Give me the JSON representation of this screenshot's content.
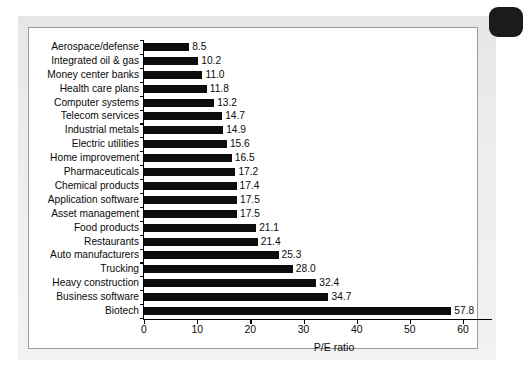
{
  "figure": {
    "card_background": "#ffffff",
    "plate_background": "#ececec",
    "bar_color": "#0d0d0d",
    "axis_color": "#000000",
    "corner_tab_color": "#1b1b1b",
    "corner_tab_name": "page-corner-tab"
  },
  "chart_data": {
    "type": "bar",
    "orientation": "horizontal",
    "title": "",
    "xlabel": "P/E ratio",
    "ylabel": "",
    "xlim": [
      0,
      60
    ],
    "xticks": [
      0,
      10,
      20,
      30,
      40,
      50,
      60
    ],
    "xtick_labels": [
      "0",
      "10",
      "20",
      "30",
      "40",
      "50",
      "60"
    ],
    "grid": false,
    "legend": null,
    "show_value_labels": true,
    "categories": [
      "Aerospace/defense",
      "Integrated oil & gas",
      "Money center banks",
      "Health care plans",
      "Computer systems",
      "Telecom services",
      "Industrial metals",
      "Electric utilities",
      "Home improvement",
      "Pharmaceuticals",
      "Chemical products",
      "Application software",
      "Asset management",
      "Food products",
      "Restaurants",
      "Auto manufacturers",
      "Trucking",
      "Heavy construction",
      "Business software",
      "Biotech"
    ],
    "values": [
      8.5,
      10.2,
      11.0,
      11.8,
      13.2,
      14.7,
      14.9,
      15.6,
      16.5,
      17.2,
      17.4,
      17.5,
      17.5,
      21.1,
      21.4,
      25.3,
      28.0,
      32.4,
      34.7,
      57.8
    ],
    "value_labels": [
      "8.5",
      "10.2",
      "11.0",
      "11.8",
      "13.2",
      "14.7",
      "14.9",
      "15.6",
      "16.5",
      "17.2",
      "17.4",
      "17.5",
      "17.5",
      "21.1",
      "21.4",
      "25.3",
      "28.0",
      "32.4",
      "34.7",
      "57.8"
    ]
  }
}
